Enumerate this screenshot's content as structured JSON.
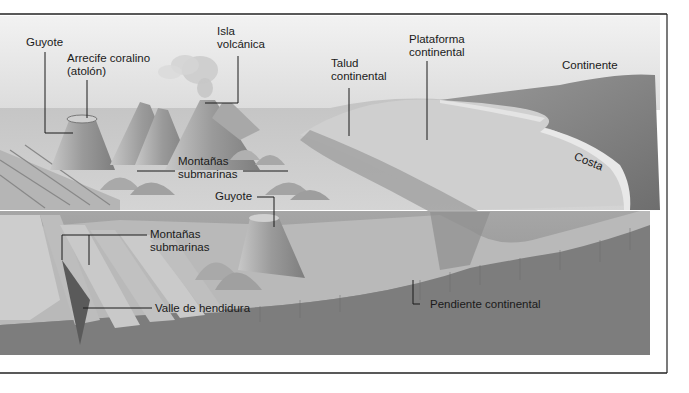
{
  "colors": {
    "sky": "#e6e6e6",
    "sea_surface": "#bdbdbd",
    "shelf": "#c9c9c9",
    "cross_section": "#8c8c8c",
    "deep_floor": "#7a7a7a",
    "continent": "#8a8a8a",
    "frame": "#222222",
    "label": "#1a1a1a"
  },
  "labels": {
    "guyote_top": "Guyote",
    "arrecife": [
      "Arrecife coralino",
      "(atolón)"
    ],
    "isla": [
      "Isla",
      "volcánica"
    ],
    "talud": [
      "Talud",
      "continental"
    ],
    "plataforma": [
      "Plataforma",
      "continental"
    ],
    "continente": "Continente",
    "costa": "Costa",
    "montanas_upper": [
      "Montañas",
      "submarinas"
    ],
    "guyote_lower": "Guyote",
    "montanas_lower": [
      "Montañas",
      "submarinas"
    ],
    "valle": "Valle de hendidura",
    "pendiente": "Pendiente continental"
  }
}
